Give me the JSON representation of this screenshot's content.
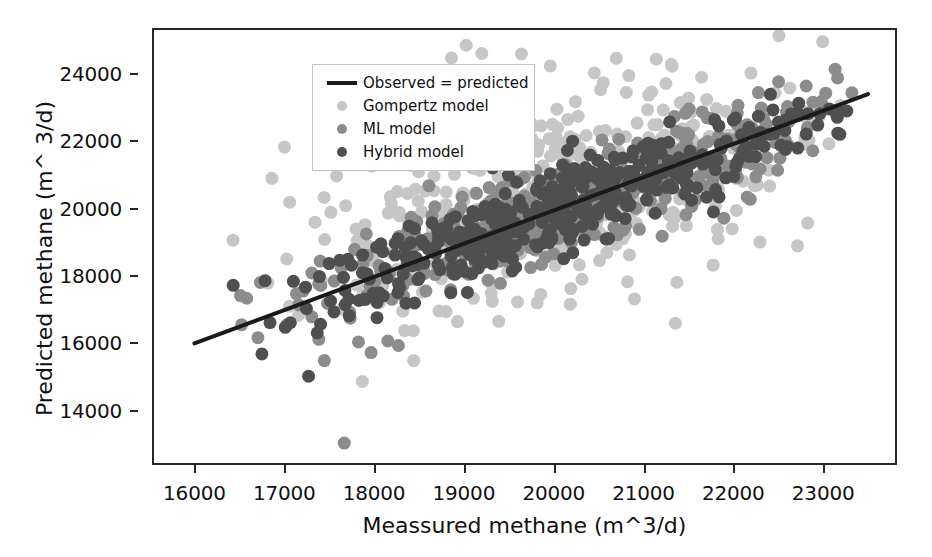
{
  "chart_data": {
    "type": "scatter",
    "title": "",
    "xlabel": "Meassured methane (m^3/d)",
    "ylabel": "Predicted methane (m^ 3/d)",
    "xlim": [
      15550,
      23800
    ],
    "ylim": [
      12450,
      25300
    ],
    "xticks": [
      16000,
      17000,
      18000,
      19000,
      20000,
      21000,
      22000,
      23000
    ],
    "xticklabels": [
      "16000",
      "17000",
      "18000",
      "19000",
      "20000",
      "21000",
      "22000",
      "23000"
    ],
    "yticks": [
      14000,
      16000,
      18000,
      20000,
      22000,
      24000
    ],
    "yticklabels": [
      "14000",
      "16000",
      "18000",
      "20000",
      "22000",
      "24000"
    ],
    "grid": false,
    "legend_position": "upper left",
    "reference_line": {
      "name": "Observed = predicted",
      "color": "#1a1a1a",
      "width": 4,
      "x_start": 16000,
      "y_start": 16000,
      "x_end": 23500,
      "y_end": 23400
    },
    "series": [
      {
        "name": "Gompertz model",
        "marker": "circle",
        "color": "#c6c6c6",
        "size": 13,
        "n_points": 430,
        "x_mean": 20050,
        "x_sd": 1500,
        "x_min": 16400,
        "x_max": 23400,
        "slope": 0.58,
        "intercept": 8600,
        "residual_sd": 1500,
        "bias": 400,
        "seed": 101
      },
      {
        "name": "ML model",
        "marker": "circle",
        "color": "#8c8c8c",
        "size": 13,
        "n_points": 400,
        "x_mean": 20050,
        "x_sd": 1450,
        "x_min": 16400,
        "x_max": 23400,
        "slope": 0.93,
        "intercept": 1380,
        "residual_sd": 760,
        "bias": -60,
        "seed": 202
      },
      {
        "name": "Hybrid model",
        "marker": "circle",
        "color": "#4f4f4f",
        "size": 13,
        "n_points": 430,
        "x_mean": 20050,
        "x_sd": 1450,
        "x_min": 16400,
        "x_max": 23400,
        "slope": 0.97,
        "intercept": 580,
        "residual_sd": 620,
        "bias": -30,
        "seed": 303
      }
    ],
    "legend_entries": [
      {
        "label": "Observed = predicted",
        "kind": "line",
        "color": "#1a1a1a"
      },
      {
        "label": "Gompertz model",
        "kind": "marker",
        "color": "#c6c6c6"
      },
      {
        "label": "ML model",
        "kind": "marker",
        "color": "#8c8c8c"
      },
      {
        "label": "Hybrid model",
        "kind": "marker",
        "color": "#4f4f4f"
      }
    ],
    "colors": {
      "axis": "#262626",
      "background": "#ffffff",
      "text": "#111111"
    }
  }
}
